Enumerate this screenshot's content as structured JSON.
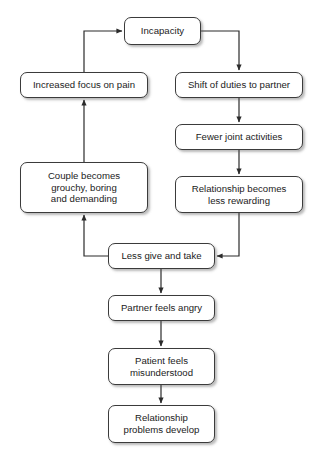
{
  "diagram": {
    "style": {
      "box_fill": "#ffffff",
      "box_border": "#3b3b3b",
      "text_color": "#1b1b1b",
      "edge_color": "#2b2b2b",
      "background": "#ffffff"
    },
    "nodes": [
      {
        "id": "incapacity",
        "label": "Incapacity",
        "x": 124,
        "y": 17,
        "w": 77,
        "h": 28
      },
      {
        "id": "increased-focus-on-pain",
        "label": "Increased focus on pain",
        "x": 20,
        "y": 72,
        "w": 128,
        "h": 26
      },
      {
        "id": "shift-of-duties-to-partner",
        "label": "Shift of duties to partner",
        "x": 175,
        "y": 72,
        "w": 128,
        "h": 26
      },
      {
        "id": "fewer-joint-activities",
        "label": "Fewer joint activities",
        "x": 175,
        "y": 124,
        "w": 128,
        "h": 26
      },
      {
        "id": "couple-becomes-grouchy",
        "label": "Couple becomes\ngrouchy, boring\nand demanding",
        "x": 20,
        "y": 162,
        "w": 128,
        "h": 51
      },
      {
        "id": "relationship-becomes-less-rewarding",
        "label": "Relationship becomes\nless rewarding",
        "x": 175,
        "y": 176,
        "w": 128,
        "h": 37
      },
      {
        "id": "less-give-and-take",
        "label": "Less give and take",
        "x": 108,
        "y": 243,
        "w": 107,
        "h": 26
      },
      {
        "id": "partner-feels-angry",
        "label": "Partner feels angry",
        "x": 108,
        "y": 295,
        "w": 107,
        "h": 26
      },
      {
        "id": "patient-feels-misunderstood",
        "label": "Patient feels\nmisunderstood",
        "x": 108,
        "y": 348,
        "w": 107,
        "h": 37
      },
      {
        "id": "relationship-problems-develop",
        "label": "Relationship\nproblems develop",
        "x": 108,
        "y": 405,
        "w": 107,
        "h": 38
      }
    ],
    "edges": [
      {
        "id": "incapacity-to-shift",
        "from": "incapacity",
        "to": "shift-of-duties-to-partner",
        "arrow": true
      },
      {
        "id": "shift-to-fewer",
        "from": "shift-of-duties-to-partner",
        "to": "fewer-joint-activities",
        "arrow": true
      },
      {
        "id": "fewer-to-relationship-less-rewarding",
        "from": "fewer-joint-activities",
        "to": "relationship-becomes-less-rewarding",
        "arrow": true
      },
      {
        "id": "relationship-less-rewarding-to-less-give-and-take",
        "from": "relationship-becomes-less-rewarding",
        "to": "less-give-and-take",
        "arrow": true
      },
      {
        "id": "less-give-and-take-to-couple-becomes",
        "from": "less-give-and-take",
        "to": "couple-becomes-grouchy",
        "arrow": true
      },
      {
        "id": "couple-becomes-to-increased-focus",
        "from": "couple-becomes-grouchy",
        "to": "increased-focus-on-pain",
        "arrow": true
      },
      {
        "id": "increased-focus-to-incapacity",
        "from": "increased-focus-on-pain",
        "to": "incapacity",
        "arrow": true
      },
      {
        "id": "less-give-and-take-to-partner-feels-angry",
        "from": "less-give-and-take",
        "to": "partner-feels-angry",
        "arrow": true
      },
      {
        "id": "partner-feels-angry-to-patient-feels-misunderstood",
        "from": "partner-feels-angry",
        "to": "patient-feels-misunderstood",
        "arrow": true
      },
      {
        "id": "patient-feels-misunderstood-to-relationship-problems",
        "from": "patient-feels-misunderstood",
        "to": "relationship-problems-develop",
        "arrow": true
      }
    ]
  }
}
